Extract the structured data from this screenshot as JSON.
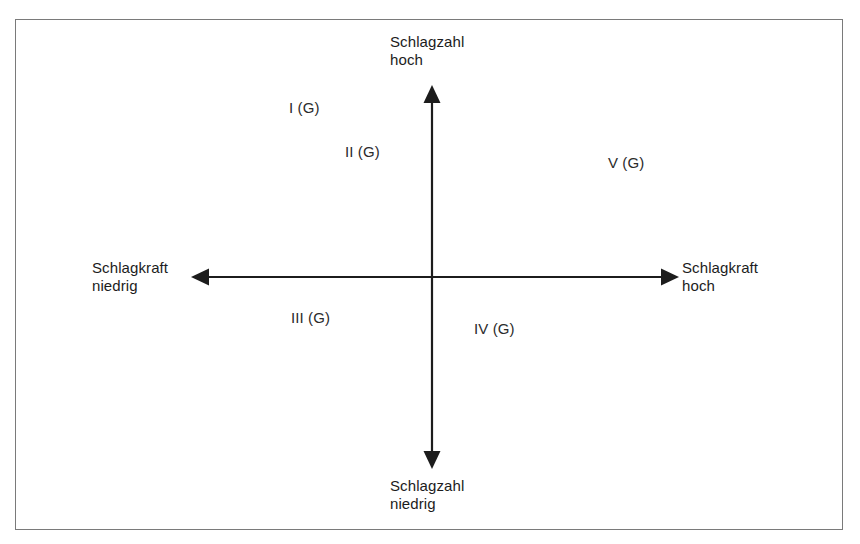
{
  "figure": {
    "type": "quadrant-matrix",
    "border_color": "#7a7a7a",
    "axis_color": "#1c1c1c",
    "text_color": "#1c1c1c",
    "background": "#ffffff"
  },
  "axes": {
    "vertical": {
      "name": "Schlagzahl",
      "top_label": "Schlagzahl\nhoch",
      "bottom_label": "Schlagzahl\nniedrig"
    },
    "horizontal": {
      "name": "Schlagkraft",
      "left_label": "Schlagkraft\nniedrig",
      "right_label": "Schlagkraft\nhoch"
    }
  },
  "quadrant_labels": [
    {
      "id": "q1",
      "text": "I (G)"
    },
    {
      "id": "q2",
      "text": "II (G)"
    },
    {
      "id": "q3",
      "text": "III (G)"
    },
    {
      "id": "q4",
      "text": "IV (G)"
    },
    {
      "id": "q5",
      "text": "V (G)"
    }
  ]
}
